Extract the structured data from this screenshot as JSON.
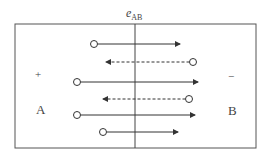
{
  "diagram": {
    "field_label": "e",
    "field_label_subscript": "AB",
    "left_plate": {
      "label": "A",
      "polarity": "+"
    },
    "right_plate": {
      "label": "B",
      "polarity": "−"
    },
    "colors": {
      "line": "#333333",
      "border": "#555555",
      "text": "#444444"
    },
    "carriers": [
      {
        "row": 1,
        "direction": "right",
        "style": "solid",
        "start_x": 94,
        "end_x": 180,
        "y": 44
      },
      {
        "row": 2,
        "direction": "left",
        "style": "dashed",
        "start_x": 193,
        "end_x": 106,
        "y": 62
      },
      {
        "row": 3,
        "direction": "right",
        "style": "solid",
        "start_x": 77,
        "end_x": 198,
        "y": 82
      },
      {
        "row": 4,
        "direction": "left",
        "style": "dashed",
        "start_x": 189,
        "end_x": 103,
        "y": 99
      },
      {
        "row": 5,
        "direction": "right",
        "style": "solid",
        "start_x": 77,
        "end_x": 195,
        "y": 115
      },
      {
        "row": 6,
        "direction": "right",
        "style": "solid",
        "start_x": 103,
        "end_x": 178,
        "y": 132
      }
    ]
  }
}
